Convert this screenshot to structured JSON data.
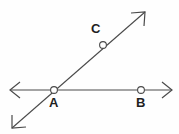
{
  "figure": {
    "canvas": {
      "width": 179,
      "height": 134
    },
    "background_color": "#fefefe",
    "stroke_color": "#4a4a4a",
    "label_color": "#1f1f1f",
    "point_fill_color": "#ffffff"
  },
  "labels": {
    "a": "A",
    "b": "B",
    "c": "C"
  },
  "points": [
    {
      "name": "A",
      "label": "A",
      "x": 54,
      "y": 90,
      "radius": 3.4,
      "label_x": 49,
      "label_y": 96
    },
    {
      "name": "B",
      "label": "B",
      "x": 141,
      "y": 90,
      "radius": 3.4,
      "label_x": 136,
      "label_y": 96
    },
    {
      "name": "C",
      "label": "C",
      "x": 103,
      "y": 45,
      "radius": 3.4,
      "label_x": 91,
      "label_y": 22
    }
  ],
  "lines": [
    {
      "name": "horizontal-line",
      "x1": 10,
      "y1": 90,
      "x2": 172,
      "y2": 90,
      "arrow_start": true,
      "arrow_end": true
    },
    {
      "name": "diagonal-line",
      "x1": 12,
      "y1": 128,
      "x2": 145,
      "y2": 12,
      "arrow_start": true,
      "arrow_end": true
    }
  ],
  "arrowheads": [
    {
      "name": "arrow-left",
      "points": "20,82 10,90 20,98"
    },
    {
      "name": "arrow-right",
      "points": "162,82 172,90 162,98"
    },
    {
      "name": "arrow-down-left",
      "points": "12,115 12,128 26,127"
    },
    {
      "name": "arrow-up-right",
      "points": "131,13 145,12 144,26"
    }
  ]
}
